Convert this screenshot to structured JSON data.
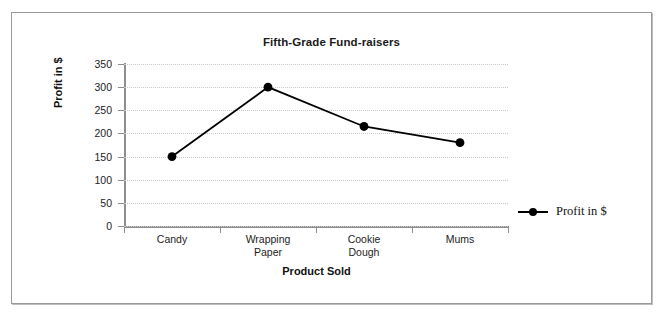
{
  "chart_data": {
    "type": "line",
    "title": "Fifth-Grade Fund-raisers",
    "xlabel": "Product Sold",
    "ylabel": "Profit in $",
    "categories": [
      "Candy",
      "Wrapping Paper",
      "Cookie Dough",
      "Mums"
    ],
    "category_lines": [
      [
        "Candy"
      ],
      [
        "Wrapping",
        "Paper"
      ],
      [
        "Cookie",
        "Dough"
      ],
      [
        "Mums"
      ]
    ],
    "series": [
      {
        "name": "Profit in $",
        "values": [
          150,
          300,
          215,
          180
        ]
      }
    ],
    "ylim": [
      0,
      350
    ],
    "ytick_step": 50,
    "yticks": [
      0,
      50,
      100,
      150,
      200,
      250,
      300,
      350
    ],
    "ytick_labels": [
      "0",
      "50",
      "100",
      "150",
      "200",
      "250",
      "300",
      "350"
    ],
    "grid": true,
    "grid_axis": "y",
    "legend_position": "right",
    "legend_entries": [
      "Profit in $"
    ],
    "colors": {
      "line": "#000000",
      "marker": "#000000",
      "grid": "#c9c9c9",
      "axis": "#8d8d8d",
      "text": "#1d1d1d",
      "background": "#ffffff",
      "frame_border": "#9a9a9a"
    }
  }
}
